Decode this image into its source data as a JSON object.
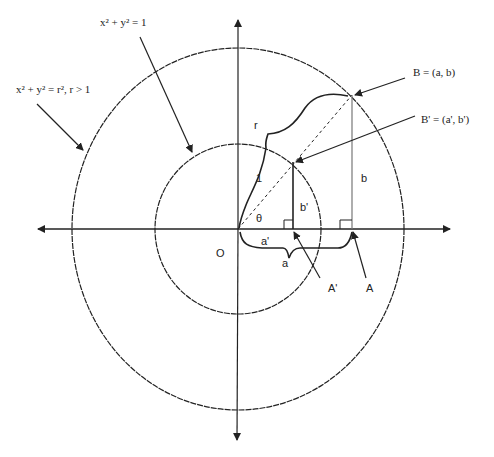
{
  "diagram": {
    "labels": {
      "outer_circle_eq": "x² + y² = r², r > 1",
      "inner_circle_eq": "x² + y² = 1",
      "point_B": "B = (a, b)",
      "point_B_prime": "B' = (a', b')",
      "origin": "O",
      "radius_r": "r",
      "radius_1": "1",
      "angle": "θ",
      "b_length": "b",
      "b_prime_length": "b'",
      "a_length": "a",
      "a_prime_length": "a'",
      "point_A": "A",
      "point_A_prime": "A'"
    },
    "geometry": {
      "origin": [
        238,
        229
      ],
      "outer_circle_radius_px": [
        166,
        181
      ],
      "inner_circle_radius_px": [
        83,
        85
      ],
      "B": [
        352,
        95
      ],
      "B_prime": [
        293,
        162
      ],
      "A": [
        352,
        229
      ],
      "A_prime": [
        293,
        229
      ]
    },
    "colors": {
      "stroke": "#222222",
      "background": "#ffffff",
      "thin_line": "#555555"
    }
  }
}
